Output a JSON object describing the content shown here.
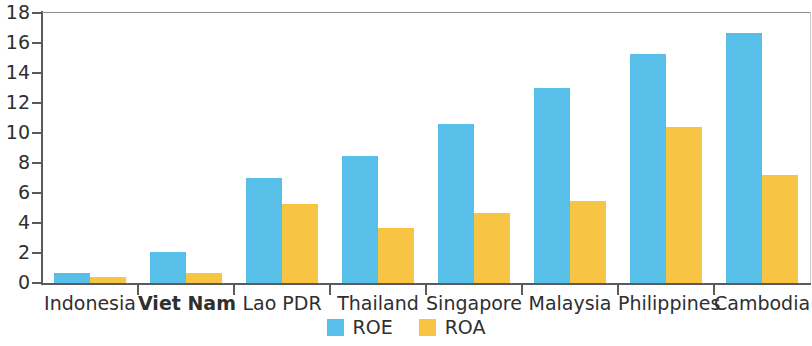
{
  "chart_data": {
    "type": "bar",
    "title": "",
    "subtitle": "",
    "xlabel": "",
    "ylabel": "",
    "ylim": [
      0,
      18
    ],
    "ytick_step": 2,
    "yticks": [
      "0",
      "2",
      "4",
      "6",
      "8",
      "10",
      "12",
      "14",
      "16",
      "18"
    ],
    "grid": false,
    "legend_position": "bottom-center",
    "highlight_category": "Viet Nam",
    "categories": [
      "Indonesia",
      "Viet Nam",
      "Lao PDR",
      "Thailand",
      "Singapore",
      "Malaysia",
      "Philippines",
      "Cambodia"
    ],
    "series": [
      {
        "name": "ROE",
        "color": "#58bfe8",
        "values": [
          0.7,
          2.1,
          7.0,
          8.5,
          10.6,
          13.0,
          15.3,
          16.7
        ]
      },
      {
        "name": "ROA",
        "color": "#f7c443",
        "values": [
          0.4,
          0.65,
          5.3,
          3.7,
          4.7,
          5.5,
          10.4,
          7.2
        ]
      }
    ],
    "legend": [
      {
        "label": "ROE",
        "color": "#58bfe8",
        "swatch": "square-swatch"
      },
      {
        "label": "ROA",
        "color": "#f7c443",
        "swatch": "square-swatch"
      }
    ]
  }
}
